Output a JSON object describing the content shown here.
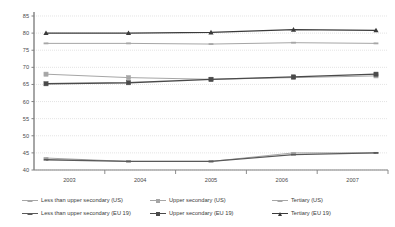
{
  "chart_data": {
    "type": "line",
    "title": "",
    "xlabel": "",
    "ylabel": "",
    "categories": [
      "2003",
      "2004",
      "2005",
      "2006",
      "2007"
    ],
    "x": [
      2003,
      2004,
      2005,
      2006,
      2007
    ],
    "ylim": [
      40,
      85
    ],
    "yticks": [
      40,
      45,
      50,
      55,
      60,
      65,
      70,
      75,
      80,
      85
    ],
    "grid": true,
    "legend_position": "bottom",
    "series": [
      {
        "name": "Less than upper secondary (US)",
        "values": [
          43.5,
          42.5,
          42.5,
          45.0,
          45.0
        ],
        "color": "#a6a6a6",
        "marker": "dash",
        "region": "US"
      },
      {
        "name": "Upper secondary (US)",
        "values": [
          68.0,
          67.0,
          66.5,
          67.0,
          67.5
        ],
        "color": "#a6a6a6",
        "marker": "square",
        "region": "US"
      },
      {
        "name": "Tertiary (US)",
        "values": [
          77.0,
          77.0,
          76.8,
          77.2,
          77.0
        ],
        "color": "#a6a6a6",
        "marker": "dash",
        "region": "US"
      },
      {
        "name": "Less than upper secondary (EU 19)",
        "values": [
          43.0,
          42.5,
          42.5,
          44.5,
          45.0
        ],
        "color": "#5a5a5a",
        "marker": "dash",
        "region": "EU 19"
      },
      {
        "name": "Upper secondary (EU 19)",
        "values": [
          65.2,
          65.5,
          66.5,
          67.2,
          68.0
        ],
        "color": "#4a4a4a",
        "marker": "square",
        "region": "EU 19"
      },
      {
        "name": "Tertiary (EU 19)",
        "values": [
          80.0,
          80.0,
          80.2,
          81.0,
          80.8
        ],
        "color": "#3a3a3a",
        "marker": "triangle",
        "region": "EU 19"
      }
    ]
  },
  "axes": {
    "y_tick_labels": [
      "85",
      "80",
      "75",
      "70",
      "65",
      "60",
      "55",
      "50",
      "45",
      "40"
    ],
    "x_tick_labels": [
      "2003",
      "2004",
      "2005",
      "2006",
      "2007"
    ]
  },
  "legend": {
    "row1": [
      {
        "label": "Less than upper secondary (US)",
        "color": "#a6a6a6",
        "marker": "dash"
      },
      {
        "label": "Upper secondary (US)",
        "color": "#a6a6a6",
        "marker": "square"
      },
      {
        "label": "Tertiary (US)",
        "color": "#a6a6a6",
        "marker": "dash"
      }
    ],
    "row2": [
      {
        "label": "Less than upper secondary (EU 19)",
        "color": "#5a5a5a",
        "marker": "dash"
      },
      {
        "label": "Upper secondary (EU 19)",
        "color": "#4a4a4a",
        "marker": "square"
      },
      {
        "label": "Tertiary (EU 19)",
        "color": "#3a3a3a",
        "marker": "triangle"
      }
    ]
  },
  "colors": {
    "background": "#ffffff",
    "grid": "#d9d9d9",
    "axis": "#808080",
    "text": "#3c3c3c"
  }
}
